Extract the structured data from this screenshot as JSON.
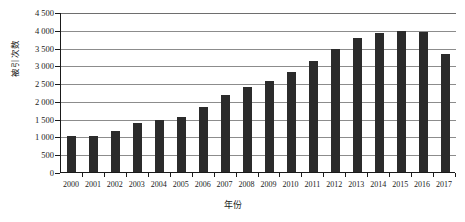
{
  "chart_data": {
    "type": "bar",
    "title": "",
    "xlabel": "年份",
    "ylabel": "被引次数",
    "categories": [
      "2000",
      "2001",
      "2002",
      "2003",
      "2004",
      "2005",
      "2006",
      "2007",
      "2008",
      "2009",
      "2010",
      "2011",
      "2012",
      "2013",
      "2014",
      "2015",
      "2016",
      "2017"
    ],
    "values": [
      1020,
      1020,
      1140,
      1390,
      1450,
      1540,
      1840,
      2170,
      2380,
      2570,
      2800,
      3110,
      3450,
      3760,
      3920,
      3960,
      3950,
      3330
    ],
    "ylim": [
      0,
      4500
    ],
    "ytick_values": [
      0,
      500,
      1000,
      1500,
      2000,
      2500,
      3000,
      3500,
      4000,
      4500
    ],
    "ytick_labels": [
      "0",
      "500",
      "1 000",
      "1 500",
      "2 000",
      "2 500",
      "3 000",
      "3 500",
      "4 000",
      "4 500"
    ],
    "grid": "horizontal",
    "legend": "none",
    "bar_color": "#2b2b2b",
    "grid_color": "#8c8c8c",
    "axis_color": "#1a1a1a"
  }
}
